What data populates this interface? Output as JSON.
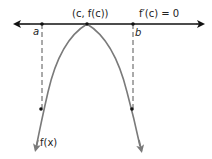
{
  "figure": {
    "tangent_label": "f′(c) = 0",
    "vertex_label": "(c, f(c))",
    "point_a_label": "a",
    "point_b_label": "b",
    "curve_label": "f(x)",
    "colors": {
      "tangent_line": "#111111",
      "curve": "#7a7a7a",
      "dashed": "#555555",
      "points": "#111111"
    }
  }
}
